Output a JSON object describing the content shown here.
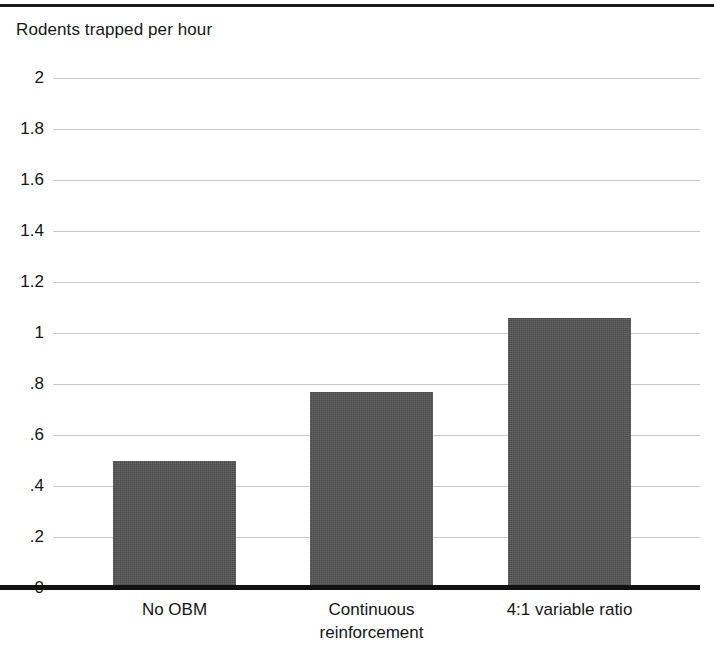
{
  "chart_data": {
    "type": "bar",
    "title": "Rodents trapped per hour",
    "xlabel": "",
    "ylabel": "Rodents trapped per hour",
    "categories": [
      "No OBM",
      "Continuous reinforcement",
      "4:1 variable ratio"
    ],
    "category_lines": [
      [
        "No OBM"
      ],
      [
        "Continuous",
        "reinforcement"
      ],
      [
        "4:1 variable ratio"
      ]
    ],
    "values": [
      0.5,
      0.77,
      1.06
    ],
    "ylim": [
      0,
      2
    ],
    "ytick_values": [
      0,
      0.2,
      0.4,
      0.6,
      0.8,
      1,
      1.2,
      1.4,
      1.6,
      1.8,
      2
    ],
    "ytick_labels": [
      "0",
      ".2",
      ".4",
      ".6",
      ".8",
      "1",
      "1.2",
      "1.4",
      "1.6",
      "1.8",
      "2"
    ],
    "grid": true,
    "legend": null,
    "bar_color": "#4a4a4a",
    "gridline_color": "#c9c9c9",
    "axis_color": "#111111"
  },
  "figure": {
    "title": "Rodents trapped per hour",
    "background": "#ffffff",
    "top_rule_color": "#1b1b1b"
  }
}
